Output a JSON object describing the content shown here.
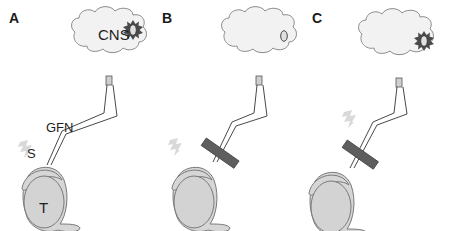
{
  "figure": {
    "panels": [
      {
        "letter": "A",
        "cns_label": "CNS",
        "nerve_label": "GFN",
        "skin_label": "S",
        "tumor_label": "T",
        "cns_state": "active-sunburst",
        "blocker": false
      },
      {
        "letter": "B",
        "cns_state": "inactive-oval",
        "blocker": true
      },
      {
        "letter": "C",
        "cns_state": "active-sunburst",
        "blocker": true
      }
    ],
    "colors": {
      "cloud_fill": "#f2f2f2",
      "cloud_stroke": "#8c8c8c",
      "body_fill": "#d6d6d6",
      "body_stroke": "#7a7a7a",
      "blocker_fill": "#5e5e5e",
      "sunburst": "#4a4a4a",
      "lightning": "#d9d9d9",
      "nerve": "#333333"
    }
  }
}
